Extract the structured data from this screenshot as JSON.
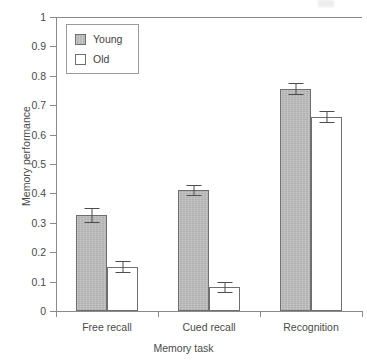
{
  "chart_data": {
    "type": "bar",
    "title": "",
    "xlabel": "Memory task",
    "ylabel": "Memory performance",
    "categories": [
      "Free recall",
      "Cued recall",
      "Recognition"
    ],
    "ylim": [
      0,
      1
    ],
    "yticks": [
      "0",
      "0.1",
      "0.2",
      "0.3",
      "0.4",
      "0.5",
      "0.6",
      "0.7",
      "0.8",
      "0.9",
      "1"
    ],
    "grid": false,
    "legend_position": "top-left",
    "series": [
      {
        "name": "Young",
        "color": "#b9b9b9",
        "values": [
          0.325,
          0.41,
          0.755
        ],
        "errors": [
          0.025,
          0.02,
          0.02
        ]
      },
      {
        "name": "Old",
        "color": "#ffffff",
        "values": [
          0.15,
          0.08,
          0.66
        ],
        "errors": [
          0.02,
          0.02,
          0.02
        ]
      }
    ]
  },
  "axis": {
    "line_color": "#8a8a8a",
    "bar_edge_color": "#6f6f6f",
    "error_color": "#4d4d4d"
  }
}
